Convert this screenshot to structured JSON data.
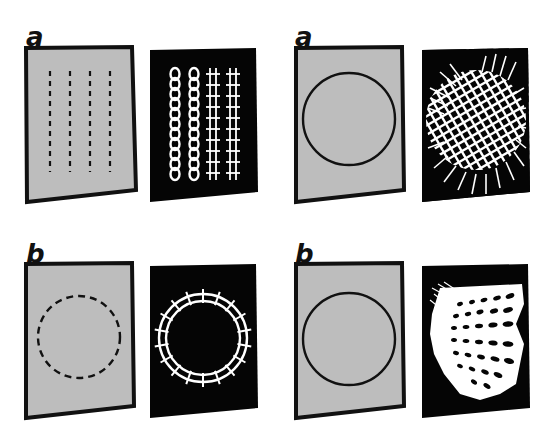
{
  "figure": {
    "panels": [
      {
        "id": "left-a",
        "label": "a",
        "pattern": "four vertical dashed lines",
        "result": "two chain-like columns and two ladder-like columns"
      },
      {
        "id": "right-a",
        "label": "a",
        "pattern": "solid circle outline",
        "result": "crosshatched grid disc with radiating lines"
      },
      {
        "id": "left-b",
        "label": "b",
        "pattern": "dashed circle outline",
        "result": "ring with cross ties"
      },
      {
        "id": "right-b",
        "label": "b",
        "pattern": "solid circle outline",
        "result": "fan-like distorted grid of leaf shapes"
      }
    ],
    "colors": {
      "background": "#ffffff",
      "card_fill": "#bdbdbd",
      "card_border": "#111111",
      "result_bg": "#050505",
      "result_fg": "#ffffff"
    }
  }
}
